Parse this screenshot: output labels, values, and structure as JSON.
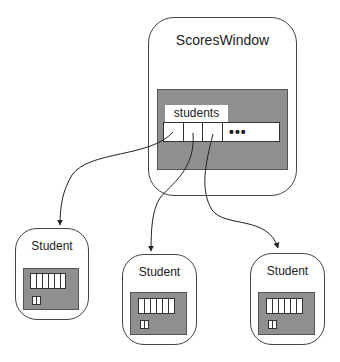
{
  "scores_window": {
    "title": "ScoresWindow",
    "field_label": "students",
    "array_cells": 3,
    "ellipsis": "•••"
  },
  "students": [
    {
      "title": "Student"
    },
    {
      "title": "Student"
    },
    {
      "title": "Student"
    }
  ],
  "colors": {
    "panel_fill": "#8f8f8f",
    "outline": "#444444",
    "background": "#ffffff"
  }
}
